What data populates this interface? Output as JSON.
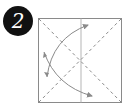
{
  "step": {
    "number": "2"
  },
  "diagram": {
    "type": "origami-fold-step",
    "square": {
      "x": 38,
      "y": 18,
      "width": 83,
      "height": 85,
      "stroke": "#8a8a8a"
    },
    "center_crease": {
      "x": 81,
      "stroke": "#b5b5b5"
    },
    "diagonals": {
      "style": "dashed",
      "stroke": "#8a8a8a"
    },
    "arrows": [
      {
        "name": "fold-up-arrow",
        "from": [
          47,
          77
        ],
        "to": [
          88,
          25
        ]
      },
      {
        "name": "fold-down-arrow",
        "from": [
          44,
          52
        ],
        "to": [
          92,
          96
        ]
      }
    ],
    "arrow_color": "#8a8a8a",
    "badge_color": "#111111"
  }
}
